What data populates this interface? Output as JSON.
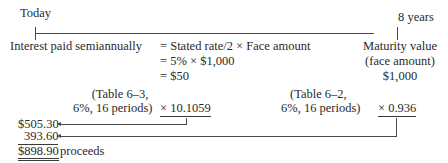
{
  "timeline": {
    "start_label": "Today",
    "end_label": "8 years"
  },
  "interest": {
    "label": "Interest paid semiannually",
    "line1": "= Stated rate/2 × Face amount",
    "line2": "= 5% × $1,000",
    "line3": "= $50"
  },
  "maturity": {
    "line1": "Maturity value",
    "line2": "(face amount)",
    "line3": "$1,000"
  },
  "annuity_factor": {
    "ref_line1": "(Table 6–3,",
    "ref_line2": "6%, 16 periods)",
    "multiplier": "× 10.1059"
  },
  "pv_factor": {
    "ref_line1": "(Table 6–2,",
    "ref_line2": "6%, 16 periods)",
    "multiplier": "× 0.936"
  },
  "results": {
    "interest_pv": "$505.30",
    "principal_pv": "393.60",
    "total": "$898.90",
    "total_label": "proceeds"
  }
}
